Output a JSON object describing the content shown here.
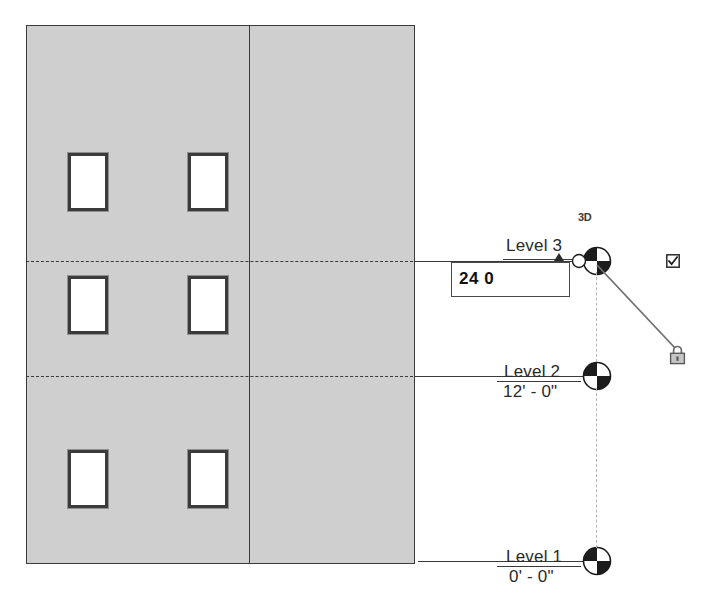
{
  "view": {
    "type": "elevation-view",
    "orientation_label": "3D",
    "background_color": "#ffffff",
    "wall_fill_color": "#cfcfcf",
    "line_color": "#3a3a3a",
    "guide_color": "#b4b4b4"
  },
  "levels": [
    {
      "id": "level-3",
      "name": "Level 3",
      "elevation": "",
      "line_style": "dashed-then-solid",
      "selected": true,
      "bubble": "level-head-bubble"
    },
    {
      "id": "level-2",
      "name": "Level 2",
      "elevation": "12' - 0\"",
      "line_style": "dashed-then-solid",
      "selected": false,
      "bubble": "level-head-bubble"
    },
    {
      "id": "level-1",
      "name": "Level 1",
      "elevation": "0' - 0\"",
      "line_style": "solid",
      "selected": false,
      "bubble": "level-head-bubble"
    }
  ],
  "dimension_editor": {
    "value": "24 0",
    "placeholder": "0' - 0\"",
    "active": true
  },
  "controls": {
    "checkbox_label": "",
    "checkbox_checked": true,
    "lock_state": "locked",
    "lock_icon": "padlock-closed-icon"
  },
  "building": {
    "window_count": 6,
    "wall_segments": 2,
    "windows": [
      {
        "id": "window-1",
        "x": 68,
        "y": 153,
        "w": 40,
        "h": 58
      },
      {
        "id": "window-2",
        "x": 188,
        "y": 153,
        "w": 40,
        "h": 58
      },
      {
        "id": "window-3",
        "x": 68,
        "y": 276,
        "w": 40,
        "h": 58
      },
      {
        "id": "window-4",
        "x": 188,
        "y": 276,
        "w": 40,
        "h": 58
      },
      {
        "id": "window-5",
        "x": 68,
        "y": 450,
        "w": 40,
        "h": 58
      },
      {
        "id": "window-6",
        "x": 188,
        "y": 450,
        "w": 40,
        "h": 58
      }
    ]
  }
}
